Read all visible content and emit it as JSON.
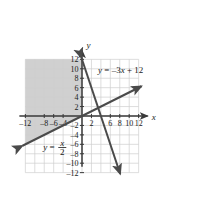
{
  "figure": {
    "type": "coordinate-graph",
    "background_color": "#ffffff",
    "grid_color": "#cfcfcf",
    "axis_color": "#3a3a3a",
    "line_color": "#4a4a4a",
    "shade_color": "#c8c8c8"
  },
  "axes": {
    "x_axis_label": "x",
    "y_axis_label": "y",
    "x_min": -12,
    "x_max": 12,
    "y_min": -12,
    "y_max": 12,
    "grid_step": 2,
    "x_ticks": [
      {
        "value": -12,
        "label": "–12"
      },
      {
        "value": -8,
        "label": "–8"
      },
      {
        "value": -6,
        "label": "–6"
      },
      {
        "value": -4,
        "label": "–4"
      },
      {
        "value": 2,
        "label": "2"
      },
      {
        "value": 6,
        "label": "6"
      },
      {
        "value": 8,
        "label": "8"
      },
      {
        "value": 10,
        "label": "10"
      },
      {
        "value": 12,
        "label": "12"
      }
    ],
    "y_ticks": [
      {
        "value": 12,
        "label": "12"
      },
      {
        "value": 10,
        "label": "10"
      },
      {
        "value": 8,
        "label": "8"
      },
      {
        "value": 6,
        "label": "6"
      },
      {
        "value": 4,
        "label": "4"
      },
      {
        "value": 2,
        "label": "2"
      },
      {
        "value": -2,
        "label": "–2"
      },
      {
        "value": -4,
        "label": "–4"
      },
      {
        "value": -6,
        "label": "–6"
      },
      {
        "value": -8,
        "label": "–8"
      },
      {
        "value": -10,
        "label": "–10"
      },
      {
        "value": -12,
        "label": "–12"
      }
    ]
  },
  "chart_data": {
    "type": "line",
    "title": "",
    "xlabel": "x",
    "ylabel": "y",
    "xlim": [
      -12,
      12
    ],
    "ylim": [
      -12,
      12
    ],
    "grid": true,
    "grid_step": 2,
    "legend": "none",
    "series": [
      {
        "name": "y = -3x + 12",
        "equation_label": "y = –3x + 12",
        "slope": -3,
        "intercept": 12,
        "points": [
          [
            -0.1,
            12.3
          ],
          [
            8.1,
            -12.3
          ]
        ],
        "arrow_start": true,
        "arrow_end": true,
        "label_position": {
          "x": 3.4,
          "y": 9.2
        }
      },
      {
        "name": "y = x/2",
        "equation_numerator": "x",
        "equation_denominator": "2",
        "equation_lhs": "y =",
        "slope": 0.5,
        "intercept": 0,
        "points": [
          [
            -12.6,
            -6.3
          ],
          [
            12.6,
            6.3
          ]
        ],
        "arrow_start": true,
        "arrow_end": true,
        "label_position": {
          "x": -8.2,
          "y": -7.1
        }
      }
    ],
    "shaded_region": {
      "description": "Region in the second quadrant bounded above by y = 12, on the right by the y-axis, and below by the line y = x/2",
      "fill": "#c8c8c8",
      "vertices": [
        [
          -12,
          12
        ],
        [
          0,
          12
        ],
        [
          0,
          0
        ],
        [
          -12,
          -6
        ]
      ]
    }
  }
}
